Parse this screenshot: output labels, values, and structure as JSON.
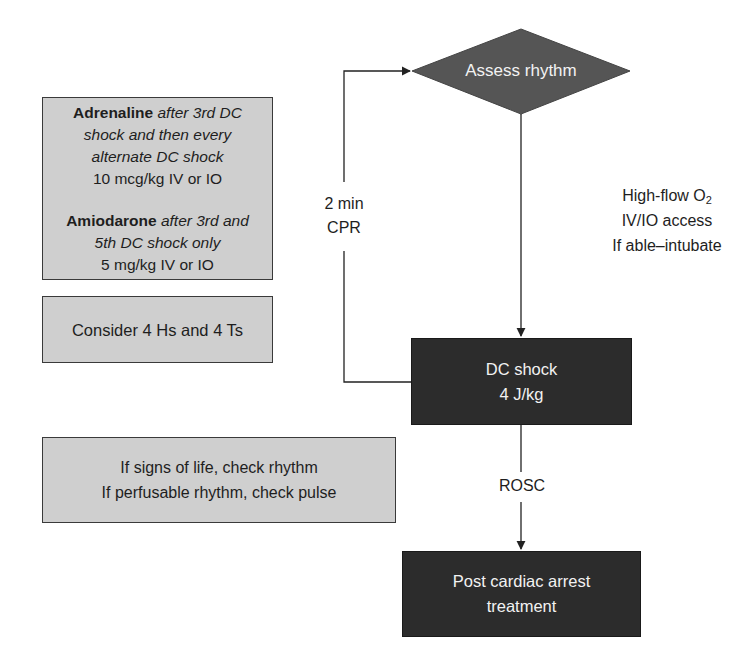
{
  "colors": {
    "light_box_fill": "#cfcfcf",
    "dark_box_fill": "#2c2c2c",
    "diamond_fill": "#555555",
    "line": "#222222",
    "dark_text": "#f2f2f2"
  },
  "decision": {
    "assess_rhythm": "Assess rhythm"
  },
  "loop": {
    "cpr_line1": "2 min",
    "cpr_line2": "CPR"
  },
  "side_actions": {
    "line1_text": "High-flow O",
    "line1_sub": "2",
    "line2": "IV/IO access",
    "line3": "If able–intubate"
  },
  "dc_shock": {
    "line1": "DC shock",
    "line2": "4 J/kg"
  },
  "rosc_label": "ROSC",
  "post_arrest": {
    "line1": "Post cardiac arrest",
    "line2": "treatment"
  },
  "drug_box": {
    "adrenaline": {
      "name": "Adrenaline",
      "timing_1": "after 3rd DC",
      "timing_2": "shock and then every",
      "timing_3": "alternate DC shock",
      "dose": "10 mcg/kg IV or IO"
    },
    "amiodarone": {
      "name": "Amiodarone",
      "timing_1": "after 3rd and",
      "timing_2": "5th DC shock only",
      "dose": "5 mg/kg IV or IO"
    }
  },
  "reversible_causes": "Consider 4 Hs and 4 Ts",
  "signs_of_life": {
    "line1": "If signs of life, check rhythm",
    "line2": "If perfusable rhythm, check pulse"
  }
}
